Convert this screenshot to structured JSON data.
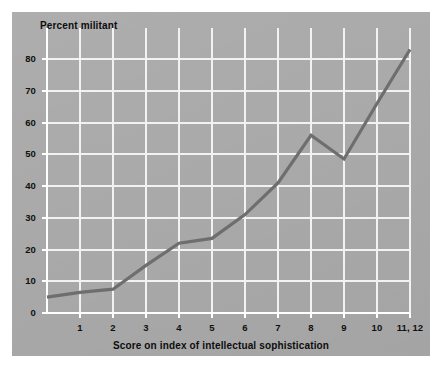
{
  "figure": {
    "background_color": "#ffffff",
    "panel_color": "#aaaaaa",
    "grid_color": "#f2f2f2",
    "axis_color": "#ffffff",
    "line_color": "#6e6e6e",
    "text_color": "#101010"
  },
  "chart_data": {
    "type": "line",
    "title": "",
    "ylabel": "Percent militant",
    "xlabel": "Score on index of intellectual sophistication",
    "categories": [
      "0",
      "1",
      "2",
      "3",
      "4",
      "5",
      "6",
      "7",
      "8",
      "9",
      "10",
      "11, 12"
    ],
    "xtick_labels": [
      "1",
      "2",
      "3",
      "4",
      "5",
      "6",
      "7",
      "8",
      "9",
      "10",
      "11, 12"
    ],
    "ytick_labels": [
      "0",
      "10",
      "20",
      "30",
      "40",
      "50",
      "60",
      "70",
      "80"
    ],
    "ytick_values": [
      0,
      10,
      20,
      30,
      40,
      50,
      60,
      70,
      80
    ],
    "values": [
      5,
      6.5,
      7.5,
      15,
      22,
      23.5,
      31,
      41,
      56,
      48.5,
      66,
      83
    ],
    "series": [
      {
        "name": "Percent militant",
        "values": [
          5,
          6.5,
          7.5,
          15,
          22,
          23.5,
          31,
          41,
          56,
          48.5,
          66,
          83
        ]
      }
    ],
    "xlim": [
      0,
      11
    ],
    "ylim": [
      0,
      86
    ],
    "grid": true,
    "legend": "none",
    "markers": "none"
  }
}
